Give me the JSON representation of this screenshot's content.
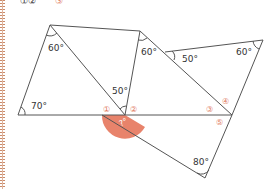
{
  "header_partial": {
    "text": "①②",
    "highlight": "③"
  },
  "diagram": {
    "line_color": "#555555",
    "accent_color": "#e8836b",
    "angles": [
      {
        "id": "top-left-apex",
        "label": "60°"
      },
      {
        "id": "center-top",
        "label": "50°"
      },
      {
        "id": "bottom-left",
        "label": "70°"
      },
      {
        "id": "top-middle",
        "label": "60°"
      },
      {
        "id": "right-middle",
        "label": "50°"
      },
      {
        "id": "top-right",
        "label": "60°"
      },
      {
        "id": "bottom",
        "label": "80°"
      },
      {
        "id": "unknown",
        "label": "?°"
      }
    ],
    "markers": [
      "①",
      "②",
      "③",
      "④",
      "⑤"
    ]
  }
}
